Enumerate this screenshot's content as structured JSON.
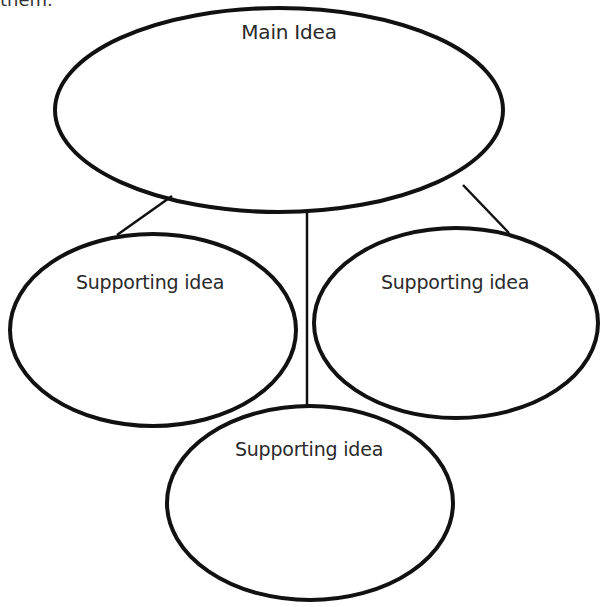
{
  "diagram": {
    "type": "main-idea-graphic-organizer",
    "top_cut_text": "them.",
    "main_idea": {
      "label": "Main Idea"
    },
    "supporting_ideas": [
      {
        "label": "Supporting idea",
        "position": "left"
      },
      {
        "label": "Supporting idea",
        "position": "right"
      },
      {
        "label": "Supporting idea",
        "position": "bottom"
      }
    ],
    "colors": {
      "stroke": "#111111",
      "text": "#2a2a2a",
      "background": "#ffffff"
    }
  }
}
